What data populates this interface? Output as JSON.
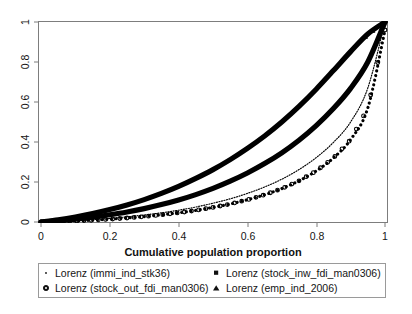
{
  "chart_data": {
    "type": "line",
    "title": "",
    "xlabel": "Cumulative population proportion",
    "ylabel": "",
    "xlim": [
      0,
      1
    ],
    "ylim": [
      0,
      1
    ],
    "grid": false,
    "x_ticks": [
      "0",
      "0.2",
      "0.4",
      "0.6",
      "0.8",
      "1"
    ],
    "x_tick_values": [
      0,
      0.2,
      0.4,
      0.6,
      0.8,
      1
    ],
    "y_ticks": [
      "0",
      "0.2",
      "0.4",
      "0.6",
      "0.8",
      "1"
    ],
    "y_tick_values": [
      0,
      0.2,
      0.4,
      0.6,
      0.8,
      1
    ],
    "legend_position": "below-plot",
    "x": [
      0,
      0.05,
      0.1,
      0.15,
      0.2,
      0.25,
      0.3,
      0.35,
      0.4,
      0.45,
      0.5,
      0.55,
      0.6,
      0.65,
      0.7,
      0.75,
      0.8,
      0.85,
      0.9,
      0.95,
      1
    ],
    "series": [
      {
        "name": "Lorenz (immi_ind_stk36)",
        "marker": "dot-small",
        "style": "fine-dotted",
        "values": [
          0,
          0.003,
          0.007,
          0.012,
          0.018,
          0.026,
          0.035,
          0.046,
          0.059,
          0.075,
          0.094,
          0.116,
          0.143,
          0.175,
          0.214,
          0.262,
          0.322,
          0.398,
          0.5,
          0.67,
          1
        ]
      },
      {
        "name": "Lorenz (stock_out_fdi_man0306)",
        "marker": "open-circle",
        "style": "circle-dotted",
        "values": [
          0,
          0.002,
          0.005,
          0.009,
          0.014,
          0.02,
          0.027,
          0.036,
          0.046,
          0.058,
          0.073,
          0.09,
          0.111,
          0.136,
          0.167,
          0.206,
          0.255,
          0.32,
          0.412,
          0.57,
          0.96
        ]
      },
      {
        "name": "Lorenz (stock_inw_fdi_man0306)",
        "marker": "square-small",
        "style": "thick-solid",
        "values": [
          0,
          0.006,
          0.014,
          0.024,
          0.036,
          0.05,
          0.067,
          0.087,
          0.11,
          0.137,
          0.168,
          0.204,
          0.245,
          0.292,
          0.346,
          0.409,
          0.482,
          0.567,
          0.668,
          0.8,
          1
        ]
      },
      {
        "name": "Lorenz (emp_ind_2006)",
        "marker": "triangle-small",
        "style": "thick-solid",
        "values": [
          0,
          0.011,
          0.025,
          0.042,
          0.062,
          0.085,
          0.112,
          0.143,
          0.178,
          0.218,
          0.262,
          0.312,
          0.368,
          0.43,
          0.5,
          0.578,
          0.664,
          0.757,
          0.852,
          0.94,
          1
        ]
      }
    ]
  },
  "legend": {
    "entries": [
      {
        "label": "Lorenz (immi_ind_stk36)",
        "marker": "dot-small-icon"
      },
      {
        "label": "Lorenz (stock_inw_fdi_man0306)",
        "marker": "square-small-icon"
      },
      {
        "label": "Lorenz (stock_out_fdi_man0306)",
        "marker": "open-circle-icon"
      },
      {
        "label": "Lorenz (emp_ind_2006)",
        "marker": "triangle-small-icon"
      }
    ]
  },
  "colors": {
    "plot_line": "#000000",
    "frame": "#7d7d7d",
    "legend_frame": "#9a9a9a",
    "background": "#ffffff",
    "text": "#151515"
  }
}
